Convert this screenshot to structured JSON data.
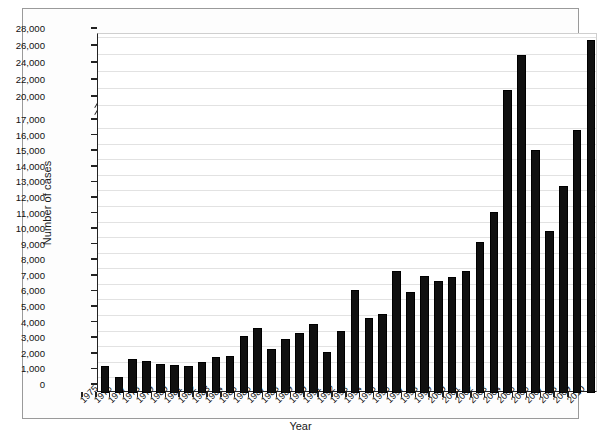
{
  "chart_data": {
    "type": "bar",
    "title": "",
    "xlabel": "Year",
    "ylabel": "Number of cases",
    "grid": true,
    "legend": "none",
    "y_axis_broken": true,
    "y_break_between": [
      17000,
      20000
    ],
    "ylim": [
      0,
      28000
    ],
    "y_ticks": [
      0,
      1000,
      2000,
      3000,
      4000,
      5000,
      6000,
      7000,
      8000,
      9000,
      10000,
      11000,
      12000,
      13000,
      14000,
      15000,
      16000,
      17000,
      20000,
      22000,
      24000,
      26000,
      28000
    ],
    "y_tick_labels": [
      "0",
      "1,000",
      "2,000",
      "3,000",
      "4,000",
      "5,000",
      "6,000",
      "7,000",
      "8,000",
      "9,000",
      "10,000",
      "11,000",
      "12,000",
      "13,000",
      "14,000",
      "15,000",
      "16,000",
      "17,000",
      "20,000",
      "22,000",
      "24,000",
      "26,000",
      "28,000"
    ],
    "categories": [
      "1975",
      "1976",
      "1977",
      "1978",
      "1979",
      "1980",
      "1981",
      "1982",
      "1983",
      "1984",
      "1985",
      "1986",
      "1987",
      "1988",
      "1989",
      "1990",
      "1991",
      "1992",
      "1993",
      "1994",
      "1995",
      "1996",
      "1997",
      "1998",
      "1999",
      "2000",
      "2001",
      "2002",
      "2003",
      "2004",
      "2005",
      "2006",
      "2007",
      "2008",
      "2009",
      "2010"
    ],
    "values": [
      1750,
      1000,
      2150,
      2050,
      1850,
      1800,
      1750,
      2000,
      2300,
      2400,
      3650,
      4150,
      2800,
      3450,
      3850,
      4400,
      2600,
      3950,
      6600,
      4800,
      5100,
      7800,
      6500,
      7500,
      7200,
      7450,
      7800,
      9700,
      11600,
      21800,
      25900,
      15600,
      10400,
      13300,
      16900,
      27700
    ],
    "units": "cases"
  },
  "axes": {
    "x_title": "Year",
    "y_title": "Number of cases"
  }
}
